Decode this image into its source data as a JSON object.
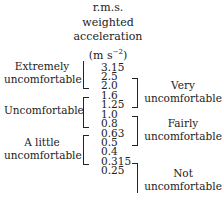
{
  "header": {
    "line1": "r.m.s.",
    "line2": "weighted",
    "line3": "acceleration",
    "unit_prefix": "(m s",
    "unit_exp": "−2",
    "unit_suffix": ")"
  },
  "values": [
    "3.15",
    "2.5",
    "2.0",
    "1.6",
    "1.25",
    "1.0",
    "0.8",
    "0.63",
    "0.5",
    "0.4",
    "0.315",
    "0.25"
  ],
  "left_labels": [
    {
      "line1": "Extremely",
      "line2": "uncomfortable",
      "range": "2.5 – 3.15 (and above)"
    },
    {
      "line1": "Uncomfortable",
      "line2": "",
      "range": "0.8 – 1.6"
    },
    {
      "line1": "A little",
      "line2": "uncomfortable",
      "range": "0.315 – 0.63"
    }
  ],
  "right_labels": [
    {
      "line1": "Very",
      "line2": "uncomfortable",
      "range": "1.25 – 2.5"
    },
    {
      "line1": "Fairly",
      "line2": "uncomfortable",
      "range": "0.5 – 1.0"
    },
    {
      "line1": "Not",
      "line2": "uncomfortable",
      "range": "below 0.315"
    }
  ],
  "colors": {
    "text": "#222222",
    "background": "#ffffff"
  }
}
